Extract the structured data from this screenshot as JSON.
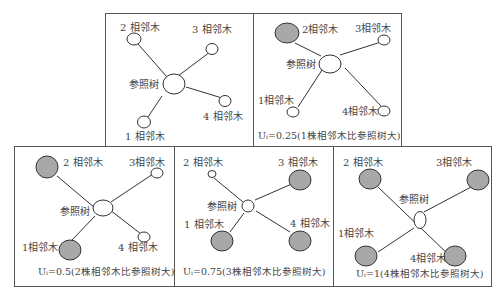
{
  "labels": {
    "reference": "参照树",
    "n1": "1相邻木",
    "n2": "2相邻木",
    "n3": "3相邻木",
    "n4": "4相邻木",
    "n1s": "1 相邻木",
    "n2s": "2 相邻木",
    "n3s": "3 相邻木",
    "n4s": "4 相邻木"
  },
  "panels": [
    {
      "id": "p0",
      "caption": ""
    },
    {
      "id": "p1",
      "caption": "Uᵢ=0.25(1株相邻木比参照树大)"
    },
    {
      "id": "p2",
      "caption": "Uᵢ=0.5(2株相邻木比参照树大)"
    },
    {
      "id": "p3",
      "caption": "Uᵢ=0.75(3株相邻木比参照树大)"
    },
    {
      "id": "p4",
      "caption": "Uᵢ=1(4株相邻木比参照树大)"
    }
  ],
  "colors": {
    "larger_tree_fill": "#a8a8a8",
    "smaller_tree_fill": "#ffffff",
    "stroke": "#333333"
  }
}
